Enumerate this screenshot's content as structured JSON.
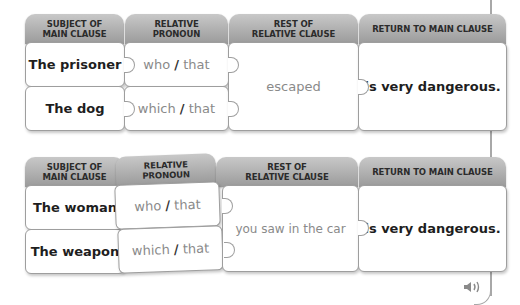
{
  "headers": {
    "subject": "SUBJECT OF\nMAIN CLAUSE",
    "subject_l1": "SUBJECT OF",
    "subject_l2": "MAIN CLAUSE",
    "pronoun_l1": "RELATIVE",
    "pronoun_l2": "PRONOUN",
    "rest_l1": "REST OF",
    "rest_l2": "RELATIVE CLAUSE",
    "return": "RETURN TO MAIN CLAUSE"
  },
  "table1": {
    "rows": [
      {
        "subject": "The prisoner",
        "pronoun_a": "who",
        "pronoun_sep": "/",
        "pronoun_b": "that"
      },
      {
        "subject": "The dog",
        "pronoun_a": "which",
        "pronoun_sep": "/",
        "pronoun_b": "that"
      }
    ],
    "rest": "escaped",
    "return": "is very dangerous."
  },
  "table2": {
    "rows": [
      {
        "subject": "The woman",
        "pronoun_a": "who",
        "pronoun_sep": "/",
        "pronoun_b": "that"
      },
      {
        "subject": "The weapon",
        "pronoun_a": "which",
        "pronoun_sep": "/",
        "pronoun_b": "that"
      }
    ],
    "rest": "you saw in the car",
    "return": "is very dangerous."
  },
  "audio": {
    "icon": "speaker-icon"
  },
  "colors": {
    "header_top": "#c8c8c8",
    "header_bottom": "#9a9a9a",
    "dark_text": "#1e1e1e",
    "grey_text": "#8a8a8a"
  }
}
